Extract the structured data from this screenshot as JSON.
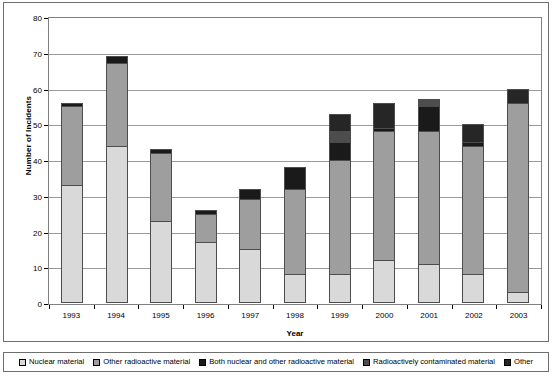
{
  "chart_data": {
    "type": "bar",
    "stacked": true,
    "title": "",
    "xlabel": "Year",
    "ylabel": "Number of Incidents",
    "categories": [
      "1993",
      "1994",
      "1995",
      "1996",
      "1997",
      "1998",
      "1999",
      "2000",
      "2001",
      "2002",
      "2003"
    ],
    "ylim": [
      0,
      80
    ],
    "yticks": [
      0,
      10,
      20,
      30,
      40,
      50,
      60,
      70,
      80
    ],
    "ytick_labels": [
      "0",
      "10",
      "20",
      "30",
      "40",
      "50",
      "60",
      "70",
      "80"
    ],
    "grid": true,
    "legend_position": "bottom",
    "series": [
      {
        "name": "Nuclear material",
        "color": "#d9d9d9",
        "values": [
          33,
          44,
          23,
          17,
          15,
          8,
          8,
          12,
          11,
          8,
          3
        ]
      },
      {
        "name": "Other radioactive material",
        "color": "#9e9e9e",
        "values": [
          22,
          23,
          19,
          8,
          14,
          24,
          32,
          36,
          37,
          36,
          53
        ]
      },
      {
        "name": "Both nuclear and other radioactive material",
        "color": "#1a1a1a",
        "values": [
          1,
          2,
          1,
          1,
          3,
          6,
          5,
          1,
          7,
          1,
          0
        ]
      },
      {
        "name": "Radioactively contaminated material",
        "color": "#4d4d4d",
        "values": [
          0,
          0,
          0,
          0,
          0,
          0,
          3,
          0,
          2,
          0,
          0
        ]
      },
      {
        "name": "Other",
        "color": "#262626",
        "values": [
          0,
          0,
          0,
          0,
          0,
          0,
          5,
          7,
          0,
          5,
          4
        ]
      }
    ],
    "totals": [
      56,
      69,
      43,
      26,
      32,
      38,
      53,
      56,
      57,
      50,
      60
    ]
  },
  "axes": {
    "y_title": "Number of Incidents",
    "x_title": "Year"
  },
  "legend": {
    "items": [
      {
        "label": "Nuclear material",
        "color": "#d9d9d9"
      },
      {
        "label": "Other radioactive material",
        "color": "#9e9e9e"
      },
      {
        "label": "Both nuclear and other radioactive material",
        "color": "#1a1a1a"
      },
      {
        "label": "Radioactively contaminated material",
        "color": "#4d4d4d"
      },
      {
        "label": "Other",
        "color": "#262626"
      }
    ]
  }
}
